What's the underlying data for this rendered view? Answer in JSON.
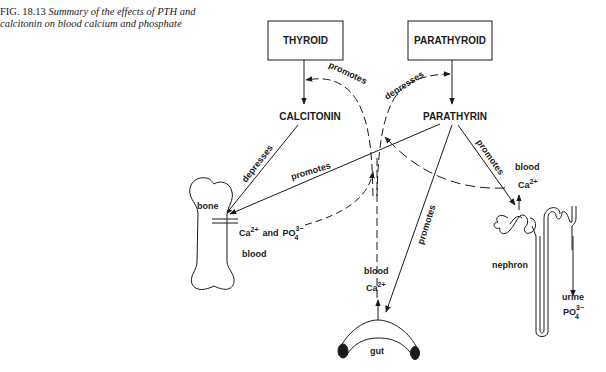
{
  "caption": {
    "figure_label": "FIG. 18.13",
    "text": "Summary of the effects of PTH and calcitonin on blood calcium and phosphate"
  },
  "boxes": {
    "thyroid": "THYROID",
    "parathyroid": "PARATHYROID"
  },
  "hormones": {
    "calcitonin": "CALCITONIN",
    "parathyrin": "PARATHYRIN"
  },
  "arrow_labels": {
    "promotes_top": "promotes",
    "depresses_top": "depresses",
    "depresses_bone": "depresses",
    "promotes_bone": "promotes",
    "promotes_kidney": "promotes",
    "promotes_gut": "promotes"
  },
  "organs": {
    "bone": "bone",
    "nephron": "nephron",
    "gut": "gut"
  },
  "ions": {
    "bone_ions_ca": "Ca",
    "bone_ions_ca_sup": "2+",
    "bone_ions_and": "and",
    "bone_ions_po": "PO",
    "bone_ions_po_sub": "4",
    "bone_ions_po_sup": "3−",
    "bone_blood": "blood",
    "gut_blood": "blood",
    "gut_ca": "Ca",
    "gut_ca_sup": "2+",
    "kidney_blood": "blood",
    "kidney_ca": "Ca",
    "kidney_ca_sup": "2+",
    "urine": "urine",
    "urine_po": "PO",
    "urine_po_sub": "4",
    "urine_po_sup": "3−"
  }
}
